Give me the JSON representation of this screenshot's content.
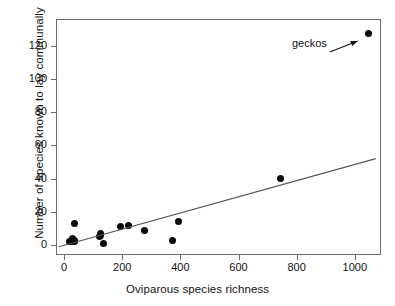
{
  "chart_data": {
    "type": "scatter",
    "title": "",
    "xlabel": "Oviparous species richness",
    "ylabel": "Number of species known to lay communally",
    "xlim": [
      -28,
      1090
    ],
    "ylim": [
      -6,
      136
    ],
    "xticks": [
      0,
      200,
      400,
      600,
      800,
      1000
    ],
    "xtick_labels": [
      "0",
      "200",
      "400",
      "600",
      "800",
      "1000"
    ],
    "yticks": [
      0,
      20,
      40,
      60,
      80,
      100,
      120
    ],
    "ytick_labels": [
      "0",
      "20",
      "40",
      "60",
      "80",
      "100",
      "120"
    ],
    "grid": false,
    "legend": false,
    "marker": "filled-circle",
    "marker_color": "#0a0a0a",
    "line_color": "#555555",
    "frame_color": "#6d6d6d",
    "points": [
      {
        "x": 18,
        "y": 2
      },
      {
        "x": 26,
        "y": 2
      },
      {
        "x": 30,
        "y": 4
      },
      {
        "x": 34,
        "y": 2
      },
      {
        "x": 36,
        "y": 3
      },
      {
        "x": 36,
        "y": 13
      },
      {
        "x": 122,
        "y": 5
      },
      {
        "x": 124,
        "y": 7
      },
      {
        "x": 126,
        "y": 6
      },
      {
        "x": 136,
        "y": 1
      },
      {
        "x": 193,
        "y": 11
      },
      {
        "x": 222,
        "y": 12
      },
      {
        "x": 278,
        "y": 9
      },
      {
        "x": 372,
        "y": 3
      },
      {
        "x": 393,
        "y": 14
      },
      {
        "x": 744,
        "y": 40
      },
      {
        "x": 1048,
        "y": 127
      }
    ],
    "trendline": {
      "type": "linear-fit",
      "x_start": -18,
      "y_start": -1,
      "x_end": 1072,
      "y_end": 52
    },
    "annotations": [
      {
        "text": "geckos",
        "target_x": 1048,
        "target_y": 127,
        "arrow": true
      }
    ]
  }
}
